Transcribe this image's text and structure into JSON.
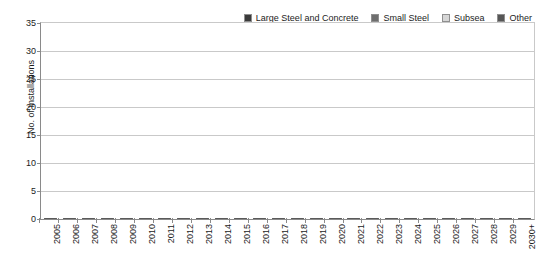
{
  "chart_data": {
    "type": "bar",
    "subtype": "stacked-vertical",
    "title": "",
    "xlabel": "",
    "ylabel": "No. of Installations",
    "ylim": [
      0,
      35
    ],
    "ytick_step": 5,
    "yticks": [
      0,
      5,
      10,
      15,
      20,
      25,
      30,
      35
    ],
    "grid": "horizontal",
    "legend_position": "top-right",
    "categories": [
      "2005",
      "2006",
      "2007",
      "2008",
      "2009",
      "2010",
      "2011",
      "2012",
      "2013",
      "2014",
      "2015",
      "2016",
      "2017",
      "2018",
      "2019",
      "2020",
      "2021",
      "2022",
      "2023",
      "2024",
      "2025",
      "2026",
      "2027",
      "2028",
      "2029",
      "2030+"
    ],
    "series": [
      {
        "name": "Large Steel and Concrete",
        "color": "#3a3a3a",
        "values": [
          0,
          0.5,
          1.5,
          1,
          1,
          0.5,
          0.5,
          0.5,
          0.5,
          2,
          0.5,
          0.5,
          1,
          1,
          1.5,
          0.5,
          0.5,
          1.5,
          0.5,
          0.5,
          0.5,
          1.5,
          0.5,
          0.5,
          0.5,
          10
        ]
      },
      {
        "name": "Small Steel",
        "color": "#6e6e6e",
        "values": [
          1.5,
          5.5,
          3.5,
          3.5,
          2,
          9,
          4,
          11.5,
          4.5,
          15,
          14,
          4.5,
          10.5,
          13,
          12.5,
          14,
          9.5,
          20,
          11.5,
          13,
          4.5,
          4.5,
          5.5,
          4,
          4.5,
          10
        ]
      },
      {
        "name": "Subsea",
        "color": "#d6d6d6",
        "values": [
          0,
          0.5,
          5,
          6.5,
          2.2,
          6.5,
          11.5,
          11.5,
          4.5,
          6,
          10.5,
          12,
          6.5,
          3.5,
          5,
          9,
          2.5,
          2,
          0.5,
          1,
          9.5,
          1,
          0.5,
          1.5,
          2.5,
          3
        ]
      },
      {
        "name": "Other",
        "color": "#565656",
        "values": [
          0,
          0.5,
          0.5,
          0.5,
          0.3,
          0.5,
          1.5,
          4,
          0.5,
          4.5,
          5.5,
          0.5,
          4.5,
          2,
          2,
          2,
          1,
          0.5,
          0.5,
          0.5,
          0.5,
          0.5,
          0.5,
          0.5,
          0.5,
          7
        ]
      }
    ],
    "totals": [
      1.5,
      7,
      10.5,
      11.5,
      5.5,
      16.5,
      17.5,
      27.5,
      10,
      27.5,
      30.5,
      17.5,
      22.5,
      19.5,
      21,
      25.5,
      13.5,
      24,
      13,
      15,
      15,
      7.5,
      7,
      6.5,
      8,
      30
    ]
  },
  "legend": {
    "entries": [
      {
        "label": "Large Steel and Concrete",
        "color": "#3a3a3a"
      },
      {
        "label": "Small Steel",
        "color": "#6e6e6e"
      },
      {
        "label": "Subsea",
        "color": "#d6d6d6"
      },
      {
        "label": "Other",
        "color": "#565656"
      }
    ]
  }
}
